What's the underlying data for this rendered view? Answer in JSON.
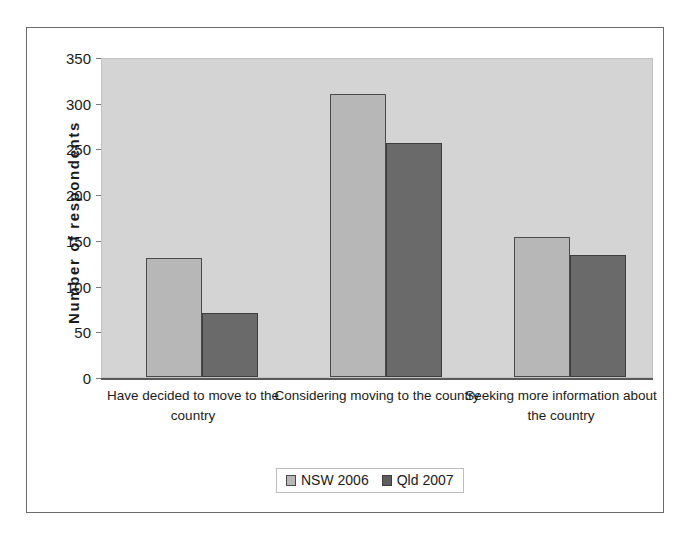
{
  "chart_data": {
    "type": "bar",
    "title": "",
    "xlabel": "",
    "ylabel": "Number of respondents",
    "categories": [
      "Have decided to move to the country",
      "Considering moving to the country",
      "Seeking more information about the country"
    ],
    "series": [
      {
        "name": "NSW 2006",
        "color": "#b7b7b7",
        "values": [
          130,
          310,
          153
        ]
      },
      {
        "name": "Qld 2007",
        "color": "#6a6a6a",
        "values": [
          70,
          256,
          133
        ]
      }
    ],
    "ylim": [
      0,
      350
    ],
    "yticks": [
      0,
      50,
      100,
      150,
      200,
      250,
      300,
      350
    ],
    "ytick_labels": [
      "0",
      "50",
      "100",
      "150",
      "200",
      "250",
      "300",
      "350"
    ],
    "grid": false,
    "legend_position": "bottom",
    "plot_background": "#d4d4d4"
  },
  "axis": {
    "y_title": "Number of respondents"
  },
  "legend": {
    "entries": [
      {
        "label": "NSW 2006"
      },
      {
        "label": "Qld 2007"
      }
    ]
  }
}
